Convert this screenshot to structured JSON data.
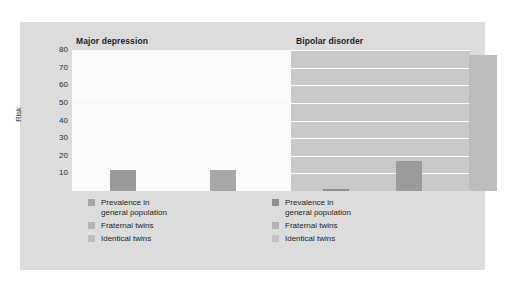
{
  "chart_data": {
    "type": "bar",
    "title": "",
    "xlabel": "",
    "ylabel": "Risk",
    "ylim": [
      0,
      80
    ],
    "ytick_values": [
      80,
      70,
      60,
      50,
      40,
      30,
      20,
      10
    ],
    "grid": true,
    "legend_position": "below-each-panel",
    "panels": [
      {
        "title": "Major depression",
        "background_color": "#fbfbfb",
        "categories": [
          "Prevalence in general population",
          "Fraternal twins",
          "Identical twins"
        ],
        "values": [
          12,
          12,
          42
        ],
        "bar_colors": [
          "#9a9a9a",
          "#a8a8a8",
          "#b0b0b0"
        ]
      },
      {
        "title": "Bipolar disorder",
        "background_color": "#c9c9c9",
        "categories": [
          "Prevalence in general population",
          "Fraternal twins",
          "Identical twins"
        ],
        "values": [
          1,
          17,
          77
        ],
        "bar_colors": [
          "#8f8f8f",
          "#9b9b9b",
          "#bdbdbd"
        ]
      }
    ],
    "legend_entries": [
      "Prevalence in\ngeneral population",
      "Fraternal twins",
      "Identical twins"
    ],
    "legend_swatch_colors_left": [
      "#a6a6a6",
      "#b4b4b4",
      "#bdbdbd"
    ],
    "legend_swatch_colors_right": [
      "#8f8f8f",
      "#b2b2b2",
      "#c2c2c2"
    ]
  },
  "figure": {
    "background_color": "#dcdcdc",
    "page_background_color": "#ffffff"
  }
}
